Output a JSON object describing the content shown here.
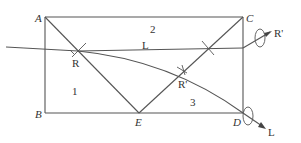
{
  "diagram": {
    "vertices": {
      "A": "A",
      "B": "B",
      "C": "C",
      "D": "D",
      "E": "E"
    },
    "regions": {
      "r1": "1",
      "r2": "2",
      "r3": "3"
    },
    "points": {
      "R_left": "R",
      "R_mid": "R'",
      "R_prime_out": "R'",
      "L_line": "L",
      "L_out": "L"
    },
    "colors": {
      "stroke": "#555555",
      "text": "#333333",
      "background": "#ffffff"
    }
  }
}
